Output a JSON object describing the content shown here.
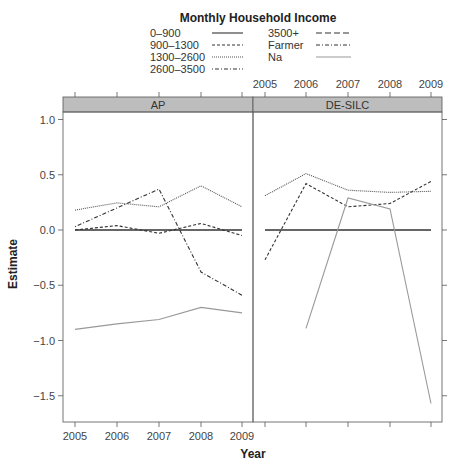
{
  "chart_data": {
    "type": "line",
    "title": "",
    "legend_title": "Monthly Household Income",
    "legend_position": "top",
    "xlabel": "Year",
    "ylabel": "Estimate",
    "ylim": [
      -1.7,
      1.1
    ],
    "yticks": [
      -1.5,
      -1.0,
      -0.5,
      0.0,
      0.5,
      1.0
    ],
    "ytick_labels": [
      "−1.5",
      "−1.0",
      "−0.5",
      "0.0",
      "0.5",
      "1.0"
    ],
    "x": [
      2005,
      2006,
      2007,
      2008,
      2009
    ],
    "xtick_labels": [
      "2005",
      "2006",
      "2007",
      "2008",
      "2009"
    ],
    "grid": false,
    "legend": [
      {
        "name": "0–900",
        "style": "solid",
        "color": "#333333"
      },
      {
        "name": "900–1300",
        "style": "dashed",
        "color": "#333333"
      },
      {
        "name": "1300–2600",
        "style": "dotted",
        "color": "#555555"
      },
      {
        "name": "2600–3500",
        "style": "dotdash",
        "color": "#333333"
      },
      {
        "name": "3500+",
        "style": "longdash",
        "color": "#333333"
      },
      {
        "name": "Farmer",
        "style": "twodash",
        "color": "#333333"
      },
      {
        "name": "Na",
        "style": "solid",
        "color": "#999999"
      }
    ],
    "panels": [
      {
        "strip": "AP",
        "series": [
          {
            "name": "0–900",
            "values": [
              0.0,
              0.0,
              0.0,
              0.0,
              0.0
            ]
          },
          {
            "name": "900–1300",
            "values": [
              0.0,
              0.04,
              -0.03,
              0.06,
              -0.05
            ]
          },
          {
            "name": "1300–2600",
            "values": [
              0.18,
              0.245,
              0.21,
              0.4,
              0.21
            ]
          },
          {
            "name": "2600–3500",
            "values": [
              0.03,
              0.2,
              0.37,
              -0.38,
              -0.59
            ]
          },
          {
            "name": "Na",
            "values": [
              -0.9,
              -0.85,
              -0.81,
              -0.7,
              -0.75
            ]
          }
        ]
      },
      {
        "strip": "DE-SILC",
        "series": [
          {
            "name": "0–900",
            "values": [
              0.0,
              0.0,
              0.0,
              0.0,
              0.0
            ]
          },
          {
            "name": "900–1300",
            "values": [
              -0.27,
              0.42,
              0.21,
              0.24,
              0.44
            ]
          },
          {
            "name": "1300–2600",
            "values": [
              0.31,
              0.51,
              0.36,
              0.34,
              0.35
            ]
          },
          {
            "name": "Na",
            "values": [
              null,
              -0.89,
              0.29,
              0.19,
              -1.57
            ]
          }
        ]
      }
    ]
  }
}
